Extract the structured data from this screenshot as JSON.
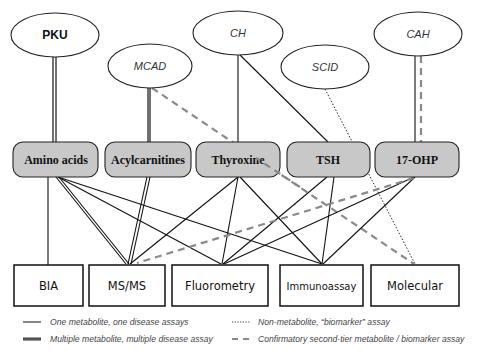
{
  "diseases": [
    {
      "id": "pku",
      "label": "PKU",
      "cx": 55,
      "cy": 35,
      "rx": 44,
      "ry": 22,
      "bold": true
    },
    {
      "id": "mcad",
      "label": "MCAD",
      "cx": 150,
      "cy": 66,
      "rx": 42,
      "ry": 22,
      "bold": false
    },
    {
      "id": "ch",
      "label": "CH",
      "cx": 238,
      "cy": 33,
      "rx": 45,
      "ry": 22,
      "bold": false
    },
    {
      "id": "scid",
      "label": "SCID",
      "cx": 325,
      "cy": 67,
      "rx": 44,
      "ry": 22,
      "bold": false
    },
    {
      "id": "cah",
      "label": "CAH",
      "cx": 418,
      "cy": 34,
      "rx": 44,
      "ry": 22,
      "bold": false
    }
  ],
  "analytes": [
    {
      "id": "amino-acids",
      "label": "Amino acids",
      "x": 13,
      "y": 142,
      "w": 85,
      "h": 35
    },
    {
      "id": "acylcarnitines",
      "label": "Acylcarnitines",
      "x": 105,
      "y": 142,
      "w": 86,
      "h": 35
    },
    {
      "id": "thyroxine",
      "label": "Thyroxine",
      "x": 196,
      "y": 142,
      "w": 84,
      "h": 35
    },
    {
      "id": "tsh",
      "label": "TSH",
      "x": 287,
      "y": 142,
      "w": 83,
      "h": 35
    },
    {
      "id": "17-ohp",
      "label": "17-OHP",
      "x": 375,
      "y": 142,
      "w": 84,
      "h": 35
    }
  ],
  "methods": [
    {
      "id": "bia",
      "label": "BIA",
      "x": 14,
      "y": 265,
      "w": 69,
      "h": 41
    },
    {
      "id": "ms-ms",
      "label": "MS/MS",
      "x": 89,
      "y": 265,
      "w": 76,
      "h": 41
    },
    {
      "id": "fluorometry",
      "label": "Fluorometry",
      "x": 172,
      "y": 265,
      "w": 96,
      "h": 41
    },
    {
      "id": "immunoassay",
      "label": "Immunoassay",
      "x": 280,
      "y": 265,
      "w": 83,
      "h": 41
    },
    {
      "id": "molecular",
      "label": "Molecular",
      "x": 371,
      "y": 265,
      "w": 88,
      "h": 41
    }
  ],
  "legend": {
    "single": "One metabolite, one disease assays",
    "multiple": "Multiple metabolite, multiple disease assay",
    "biomarker": "Non-metabolite, “biomarker” assay",
    "confirmatory": "Confirmatory second-tier metabolite / biomarker assay"
  },
  "colors": {
    "analyte_fill": "#c8c8c8",
    "line": "#111111",
    "dashed": "#8a8a8a",
    "legend_text": "#444444"
  }
}
